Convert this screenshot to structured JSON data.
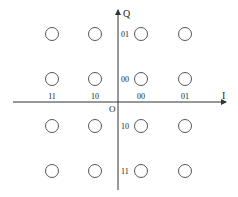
{
  "diagram": {
    "axes": {
      "horizontal_label": "I",
      "vertical_label": "Q",
      "origin_label": "O"
    },
    "i_bit_labels": [
      {
        "text": "11",
        "x": 52
      },
      {
        "text": "10",
        "x": 95
      },
      {
        "text": "00",
        "x": 141
      },
      {
        "text": "01",
        "x": 185
      }
    ],
    "q_bit_labels": [
      {
        "text": "01",
        "y": 34
      },
      {
        "text": "00",
        "y": 79
      },
      {
        "text": "10",
        "y": 126
      },
      {
        "text": "11",
        "y": 171
      }
    ],
    "constellation": {
      "columns_x": [
        52,
        95,
        141,
        185
      ],
      "rows_y": [
        34,
        79,
        126,
        171
      ],
      "point_radius": 6.5
    },
    "colors": {
      "line": "#333333",
      "point_stroke": "#444444",
      "text": "#222222"
    }
  }
}
